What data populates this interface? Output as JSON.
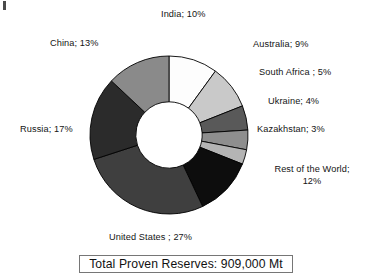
{
  "figure": {
    "title": "",
    "total_label": "Total Proven Reserves: 909,000 Mt",
    "corner_mark": "corner-artifact"
  },
  "labels": {
    "india": "India; 10%",
    "australia": "Australia; 9%",
    "south_africa": "South Africa ; 5%",
    "ukraine": "Ukraine; 4%",
    "kazakhstan": "Kazakhstan; 3%",
    "rest_of_world_line1": "Rest of the World;",
    "rest_of_world_line2": "12%",
    "united_states": "United States ; 27%",
    "russia": "Russia; 17%",
    "china": "China; 13%"
  },
  "chart_data": {
    "type": "pie",
    "variant": "donut",
    "title": "",
    "subtitle": "",
    "xlabel": "",
    "ylabel": "",
    "units": "percent of total proven reserves",
    "total_annotation": "Total Proven Reserves: 909,000 Mt",
    "total_value": 909000,
    "total_units": "Mt",
    "legend_position": "around-slices",
    "grid": false,
    "start_angle_deg": 0,
    "direction": "clockwise",
    "inner_radius_ratio": 0.42,
    "labels": [
      "India",
      "Australia",
      "South Africa",
      "Ukraine",
      "Kazakhstan",
      "Rest of the World",
      "United States",
      "Russia",
      "China"
    ],
    "values": [
      10,
      9,
      5,
      4,
      3,
      12,
      27,
      17,
      13
    ],
    "colors": [
      "#fdfdfd",
      "#c9c9c9",
      "#595959",
      "#8e8e8e",
      "#b4b4b4",
      "#0d0d0d",
      "#3f3f3f",
      "#2b2b2b",
      "#8a8a8a"
    ],
    "slices": [
      {
        "label": "India",
        "value": 10,
        "display": "India; 10%",
        "color": "#fdfdfd"
      },
      {
        "label": "Australia",
        "value": 9,
        "display": "Australia; 9%",
        "color": "#c9c9c9"
      },
      {
        "label": "South Africa",
        "value": 5,
        "display": "South Africa ; 5%",
        "color": "#595959"
      },
      {
        "label": "Ukraine",
        "value": 4,
        "display": "Ukraine; 4%",
        "color": "#8e8e8e"
      },
      {
        "label": "Kazakhstan",
        "value": 3,
        "display": "Kazakhstan; 3%",
        "color": "#b4b4b4"
      },
      {
        "label": "Rest of the World",
        "value": 12,
        "display": "Rest of the World; 12%",
        "color": "#0d0d0d"
      },
      {
        "label": "United States",
        "value": 27,
        "display": "United States ; 27%",
        "color": "#3f3f3f"
      },
      {
        "label": "Russia",
        "value": 17,
        "display": "Russia; 17%",
        "color": "#2b2b2b"
      },
      {
        "label": "China",
        "value": 13,
        "display": "China; 13%",
        "color": "#8a8a8a"
      }
    ]
  },
  "style": {
    "slice_outline": "#000000",
    "background": "#ffffff",
    "box_border": "#767676",
    "text_color": "#141414"
  }
}
